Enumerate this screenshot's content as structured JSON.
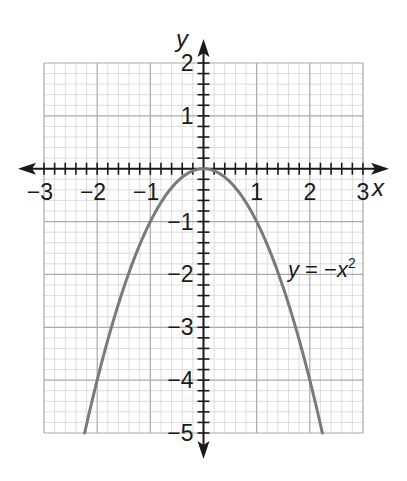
{
  "chart_data": {
    "type": "line",
    "title": "",
    "xlabel": "x",
    "ylabel": "y",
    "xlim": [
      -3,
      3
    ],
    "ylim": [
      -5,
      2
    ],
    "grid": true,
    "grid_minor_step": 0.2,
    "grid_major_step": 1,
    "x_ticks": [
      -3,
      -2,
      -1,
      1,
      2,
      3
    ],
    "x_tick_labels": [
      "−3",
      "−2",
      "−1",
      "1",
      "2",
      "3"
    ],
    "y_ticks": [
      2,
      1,
      -1,
      -2,
      -3,
      -4,
      -5
    ],
    "y_tick_labels": [
      "2",
      "1",
      "−1",
      "−2",
      "−3",
      "−4",
      "−5"
    ],
    "series": [
      {
        "name": "y = −x²",
        "function": "-x^2",
        "x": [
          -2.236,
          -2,
          -1.5,
          -1,
          -0.5,
          0,
          0.5,
          1,
          1.5,
          2,
          2.236
        ],
        "values": [
          -5,
          -4,
          -2.25,
          -1,
          -0.25,
          0,
          -0.25,
          -1,
          -2.25,
          -4,
          -5
        ],
        "color": "#7a7a7a"
      }
    ],
    "annotations": [
      {
        "text_y": "y",
        "text_eq": " = −",
        "text_x": "x",
        "text_exp": "2",
        "at": [
          1.6,
          -1.95
        ]
      }
    ],
    "legend": "none"
  },
  "colors": {
    "axis": "#1a1a1a",
    "grid_minor": "#d4d4d4",
    "grid_major": "#a8a8a8",
    "curve": "#7a7a7a"
  },
  "labels": {
    "x_axis": "x",
    "y_axis": "y",
    "eq_y": "y",
    "eq_mid": " = −",
    "eq_x": "x",
    "eq_exp": "2"
  }
}
